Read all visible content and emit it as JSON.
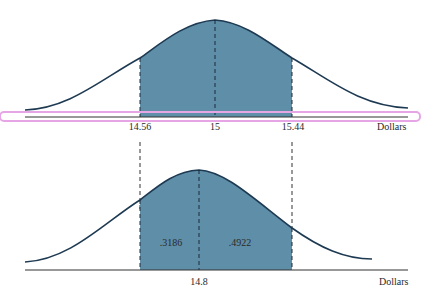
{
  "figure": {
    "top_panel": {
      "mean_label": "15",
      "left_bound_label": "14.56",
      "right_bound_label": "15.44",
      "axis_label": "Dollars"
    },
    "bottom_panel": {
      "mean_label": "14.8",
      "left_area_label": ".3186",
      "right_area_label": ".4922",
      "axis_label": "Dollars"
    },
    "colors": {
      "shade": "#5f8ea8",
      "curve": "#1e3a52",
      "axis": "#333333",
      "highlight": "#e6a6e6"
    }
  }
}
